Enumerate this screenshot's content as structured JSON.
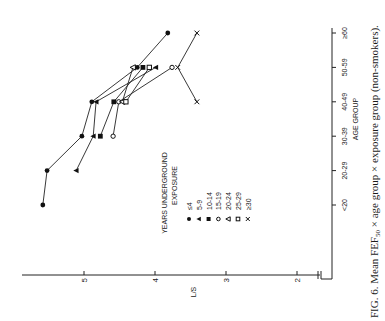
{
  "chart_data": {
    "type": "line",
    "orientation_note": "figure rendered rotated 90 degrees counter-clockwise",
    "title": "",
    "caption": "FIG. 6. Mean FEF50 × age group × exposure group (non-smokers).",
    "caption_parts": {
      "prefix": "FIG. 6. Mean FEF",
      "sub": "50",
      "suffix": " × age group × exposure group (non-smokers)."
    },
    "xlabel": "AGE GROUP",
    "ylabel": "L/S",
    "categories": [
      "<20",
      "20-29",
      "30-39",
      "40-49",
      "50-59",
      "≥60"
    ],
    "y_ticks": [
      5,
      4,
      3,
      2
    ],
    "ylim": [
      1.6,
      5.75
    ],
    "grid": false,
    "legend": {
      "title_line1": "YEARS  UNDERGROUND",
      "title_line2": "EXPOSURE",
      "position": "inside, center-left"
    },
    "series": [
      {
        "name": "≤4",
        "marker": "filled-circle",
        "values": [
          5.58,
          5.52,
          5.03,
          4.89,
          4.25,
          3.82
        ]
      },
      {
        "name": "5-9",
        "marker": "filled-triangle",
        "values": [
          null,
          5.11,
          4.87,
          4.83,
          3.99,
          null
        ]
      },
      {
        "name": "10-14",
        "marker": "filled-square",
        "values": [
          null,
          null,
          4.77,
          4.58,
          4.17,
          null
        ]
      },
      {
        "name": "15-19",
        "marker": "open-circle",
        "values": [
          null,
          null,
          4.59,
          4.51,
          3.76,
          null
        ]
      },
      {
        "name": "20-24",
        "marker": "open-triangle",
        "values": [
          null,
          null,
          null,
          4.46,
          4.31,
          null
        ]
      },
      {
        "name": "25-29",
        "marker": "open-square",
        "values": [
          null,
          null,
          null,
          4.41,
          4.08,
          null
        ]
      },
      {
        "name": "≥30",
        "marker": "x",
        "values": [
          null,
          null,
          null,
          3.41,
          3.68,
          3.41
        ]
      }
    ]
  }
}
